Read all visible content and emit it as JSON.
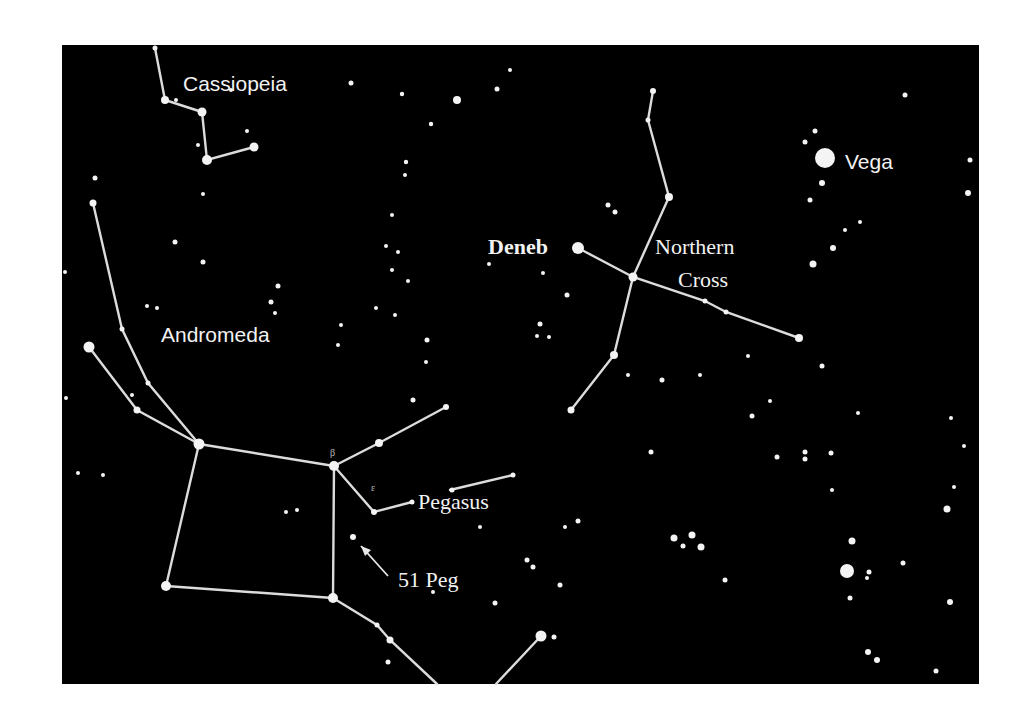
{
  "panel": {
    "x": 62,
    "y": 45,
    "width": 917,
    "height": 639,
    "background": "#000000",
    "page_background": "#ffffff"
  },
  "labels": [
    {
      "id": "cassiopeia",
      "text": "Cassiopeia",
      "x": 183,
      "y": 91,
      "font": "sans"
    },
    {
      "id": "andromeda",
      "text": "Andromeda",
      "x": 161,
      "y": 342,
      "font": "sans"
    },
    {
      "id": "deneb",
      "text": "Deneb",
      "x": 488,
      "y": 254,
      "font": "serif"
    },
    {
      "id": "northern",
      "text": "Northern",
      "x": 655,
      "y": 254,
      "font": "serif"
    },
    {
      "id": "cross",
      "text": "Cross",
      "x": 678,
      "y": 287,
      "font": "serif"
    },
    {
      "id": "vega",
      "text": "Vega",
      "x": 845,
      "y": 169,
      "font": "sans"
    },
    {
      "id": "pegasus",
      "text": "Pegasus",
      "x": 418,
      "y": 509,
      "font": "serif"
    },
    {
      "id": "51peg",
      "text": "51 Peg",
      "x": 398,
      "y": 587,
      "font": "serif"
    }
  ],
  "constellation_lines": [
    {
      "name": "Cassiopeia",
      "points": [
        [
          155,
          48
        ],
        [
          165,
          100
        ],
        [
          202,
          112
        ],
        [
          207,
          160
        ],
        [
          254,
          147
        ]
      ]
    },
    {
      "name": "Andromeda-north",
      "points": [
        [
          93,
          203
        ],
        [
          122,
          329
        ],
        [
          148,
          383
        ],
        [
          199,
          444
        ]
      ]
    },
    {
      "name": "Andromeda-west",
      "points": [
        [
          89,
          347
        ],
        [
          137,
          410
        ],
        [
          199,
          444
        ]
      ]
    },
    {
      "name": "Pegasus-square-top",
      "points": [
        [
          199,
          444
        ],
        [
          334,
          466
        ]
      ]
    },
    {
      "name": "Pegasus-square-left",
      "points": [
        [
          199,
          444
        ],
        [
          166,
          586
        ]
      ]
    },
    {
      "name": "Pegasus-square-bottom",
      "points": [
        [
          166,
          586
        ],
        [
          333,
          598
        ]
      ]
    },
    {
      "name": "Pegasus-square-right",
      "points": [
        [
          334,
          466
        ],
        [
          333,
          598
        ]
      ]
    },
    {
      "name": "Pegasus-neck",
      "points": [
        [
          334,
          466
        ],
        [
          379,
          443
        ],
        [
          446,
          407
        ]
      ]
    },
    {
      "name": "Pegasus-head",
      "points": [
        [
          334,
          466
        ],
        [
          374,
          512
        ],
        [
          412,
          502
        ]
      ]
    },
    {
      "name": "Pegasus-ear",
      "points": [
        [
          450,
          490
        ],
        [
          513,
          475
        ]
      ]
    },
    {
      "name": "Pegasus-south",
      "points": [
        [
          333,
          598
        ],
        [
          377,
          625
        ],
        [
          390,
          640
        ],
        [
          437,
          684
        ]
      ]
    },
    {
      "name": "Pegasus-southeast",
      "points": [
        [
          496,
          684
        ],
        [
          541,
          636
        ]
      ]
    },
    {
      "name": "Cygnus-long",
      "points": [
        [
          653,
          91
        ],
        [
          648,
          120
        ],
        [
          669,
          197
        ],
        [
          633,
          277
        ],
        [
          614,
          355
        ],
        [
          571,
          410
        ]
      ]
    },
    {
      "name": "Cygnus-cross",
      "points": [
        [
          578,
          248
        ],
        [
          633,
          277
        ],
        [
          705,
          301
        ],
        [
          726,
          312
        ],
        [
          799,
          338
        ]
      ]
    }
  ],
  "stars": [
    [
      155,
      48,
      2.5
    ],
    [
      165,
      100,
      4
    ],
    [
      202,
      112,
      4.5
    ],
    [
      207,
      160,
      5
    ],
    [
      254,
      147,
      4.5
    ],
    [
      198,
      145,
      2
    ],
    [
      176,
      100,
      2
    ],
    [
      203,
      194,
      2
    ],
    [
      231,
      90,
      2
    ],
    [
      247,
      131,
      2
    ],
    [
      351,
      83,
      2.5
    ],
    [
      402,
      94,
      2.2
    ],
    [
      457,
      100,
      4
    ],
    [
      497,
      89,
      2.5
    ],
    [
      510,
      70,
      2
    ],
    [
      431,
      124,
      2.2
    ],
    [
      406,
      162,
      2.2
    ],
    [
      405,
      175,
      2
    ],
    [
      392,
      215,
      2
    ],
    [
      386,
      246
    ],
    [
      398,
      252
    ],
    [
      392,
      270
    ],
    [
      408,
      281
    ],
    [
      376,
      308
    ],
    [
      395,
      315
    ],
    [
      341,
      325
    ],
    [
      338,
      345
    ],
    [
      93,
      203,
      3.5
    ],
    [
      95,
      178,
      2.5
    ],
    [
      122,
      329,
      2.5
    ],
    [
      148,
      383,
      2.5
    ],
    [
      199,
      444,
      5.5
    ],
    [
      89,
      347,
      5.5
    ],
    [
      137,
      410,
      3.5
    ],
    [
      132,
      395,
      2
    ],
    [
      175,
      242,
      2.5
    ],
    [
      203,
      262,
      2.5
    ],
    [
      147,
      306,
      2
    ],
    [
      157,
      308,
      2
    ],
    [
      271,
      302,
      2.5
    ],
    [
      275,
      313,
      2
    ],
    [
      278,
      286,
      2.5
    ],
    [
      66,
      398,
      2
    ],
    [
      78,
      473,
      2
    ],
    [
      103,
      475,
      2
    ],
    [
      65,
      272,
      2
    ],
    [
      334,
      466,
      5
    ],
    [
      379,
      443,
      4
    ],
    [
      446,
      407,
      3
    ],
    [
      374,
      512,
      3
    ],
    [
      412,
      502,
      2.5
    ],
    [
      452,
      490,
      2.5
    ],
    [
      513,
      475,
      2.5
    ],
    [
      353,
      537,
      3
    ],
    [
      286,
      512,
      2
    ],
    [
      297,
      510,
      2
    ],
    [
      166,
      586,
      5
    ],
    [
      333,
      598,
      5
    ],
    [
      377,
      625,
      2.5
    ],
    [
      390,
      640,
      3.5
    ],
    [
      388,
      662,
      2.5
    ],
    [
      541,
      636,
      5.5
    ],
    [
      554,
      637,
      2.5
    ],
    [
      533,
      567,
      2.5
    ],
    [
      560,
      585,
      2.5
    ],
    [
      433,
      592,
      2
    ],
    [
      495,
      603,
      2.5
    ],
    [
      565,
      527,
      2
    ],
    [
      480,
      527,
      2
    ],
    [
      413,
      400,
      2.5
    ],
    [
      427,
      340,
      2.5
    ],
    [
      426,
      362,
      2
    ],
    [
      578,
      248,
      6
    ],
    [
      653,
      91,
      3
    ],
    [
      648,
      120,
      2.5
    ],
    [
      669,
      197,
      4
    ],
    [
      633,
      277,
      4.5
    ],
    [
      614,
      355,
      4
    ],
    [
      571,
      410,
      3.5
    ],
    [
      705,
      301,
      2.5
    ],
    [
      726,
      312,
      2.5
    ],
    [
      799,
      338,
      4
    ],
    [
      608,
      205,
      2.5
    ],
    [
      615,
      212,
      2.5
    ],
    [
      489,
      264,
      2
    ],
    [
      543,
      273,
      2
    ],
    [
      567,
      295,
      2.5
    ],
    [
      540,
      324,
      2.5
    ],
    [
      537,
      336,
      2
    ],
    [
      549,
      337,
      2
    ],
    [
      628,
      375,
      2
    ],
    [
      662,
      380,
      2.5
    ],
    [
      700,
      375,
      2
    ],
    [
      748,
      356,
      2
    ],
    [
      825,
      158,
      10
    ],
    [
      815,
      131,
      2.5
    ],
    [
      805,
      142,
      2.5
    ],
    [
      822,
      183,
      3
    ],
    [
      810,
      200,
      2.5
    ],
    [
      833,
      248,
      3
    ],
    [
      845,
      230,
      2
    ],
    [
      860,
      222,
      2
    ],
    [
      905,
      95,
      2.5
    ],
    [
      970,
      160,
      2.5
    ],
    [
      968,
      193,
      3
    ],
    [
      813,
      264,
      3.5
    ],
    [
      822,
      366,
      2.5
    ],
    [
      951,
      418
    ],
    [
      964,
      446
    ],
    [
      954,
      487
    ],
    [
      947,
      509,
      3.5
    ],
    [
      752,
      416,
      2.5
    ],
    [
      831,
      453,
      2.5
    ],
    [
      777,
      457,
      2.5
    ],
    [
      805,
      452,
      2.5
    ],
    [
      805,
      459,
      2.5
    ],
    [
      832,
      490,
      2
    ],
    [
      852,
      541,
      3.5
    ],
    [
      847,
      571,
      7
    ],
    [
      869,
      572,
      2.5
    ],
    [
      867,
      578,
      2
    ],
    [
      903,
      563,
      2.5
    ],
    [
      850,
      598,
      2.5
    ],
    [
      950,
      602,
      3
    ],
    [
      868,
      652,
      3
    ],
    [
      877,
      660,
      3
    ],
    [
      936,
      671,
      2.5
    ],
    [
      674,
      538,
      3.5
    ],
    [
      692,
      535,
      3.5
    ],
    [
      683,
      546,
      2.5
    ],
    [
      701,
      547,
      3.5
    ],
    [
      725,
      580,
      2.5
    ],
    [
      578,
      521,
      2.5
    ],
    [
      527,
      560,
      2.5
    ],
    [
      651,
      452,
      2.5
    ],
    [
      770,
      401,
      2
    ],
    [
      858,
      413,
      2
    ]
  ],
  "arrow": {
    "from": [
      388,
      576
    ],
    "to": [
      361,
      546
    ]
  },
  "greek_letters": [
    {
      "text": "β",
      "x": 330,
      "y": 456
    },
    {
      "text": "ε",
      "x": 371,
      "y": 491
    }
  ]
}
